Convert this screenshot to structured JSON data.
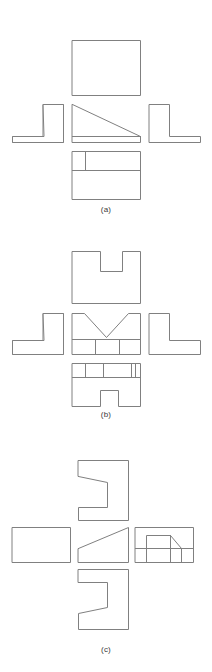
{
  "document": {
    "type": "orthographic-multiview-engineering-drawings",
    "background_color": "#ffffff",
    "line_color": "#808080",
    "figure_count": 3
  },
  "figures": [
    {
      "id": "a",
      "caption": "(a)",
      "view_layout": "cross",
      "views": [
        {
          "name": "top-view",
          "shape": "plain-rectangle"
        },
        {
          "name": "left-view",
          "shape": "mirrored-L-shape"
        },
        {
          "name": "front-view",
          "shape": "right-triangle-wedge-on-base"
        },
        {
          "name": "right-view",
          "shape": "L-shape"
        },
        {
          "name": "bottom-view",
          "shape": "rectangle-with-horizontal-divider-and-short-vertical-line"
        }
      ]
    },
    {
      "id": "b",
      "caption": "(b)",
      "view_layout": "cross",
      "views": [
        {
          "name": "top-view",
          "shape": "rectangle-with-U-notch-in-top-edge"
        },
        {
          "name": "left-view",
          "shape": "mirrored-L-shape"
        },
        {
          "name": "front-view",
          "shape": "V-notch-over-three-segment-base"
        },
        {
          "name": "right-view",
          "shape": "L-shape"
        },
        {
          "name": "bottom-view",
          "shape": "banded-rectangle-with-bottom-notch"
        }
      ]
    },
    {
      "id": "c",
      "caption": "(c)",
      "view_layout": "cross",
      "views": [
        {
          "name": "top-view",
          "shape": "C-profile-with-angled-upper-edge"
        },
        {
          "name": "left-view",
          "shape": "plain-rectangle"
        },
        {
          "name": "front-view",
          "shape": "inclined-wedge-rising-right"
        },
        {
          "name": "right-view",
          "shape": "rectangle-with-raised-block-and-chamfer"
        },
        {
          "name": "bottom-view",
          "shape": "C-profile-with-angled-lower-edge"
        }
      ]
    }
  ]
}
